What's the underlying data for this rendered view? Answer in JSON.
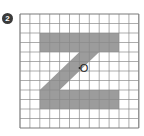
{
  "problem": {
    "number_label": "2"
  },
  "figure": {
    "grid": {
      "cols": 12,
      "rows": 12,
      "left": 20,
      "top": 14,
      "cell_w": 9.9,
      "cell_h": 9.5,
      "line_color": "#8a8a8a",
      "border_color": "#7a7a7a"
    },
    "shape": {
      "name": "Z",
      "fill": "#9c9c9c",
      "polygon_cells": [
        [
          2,
          2
        ],
        [
          10,
          2
        ],
        [
          10,
          4
        ],
        [
          8,
          4
        ],
        [
          4,
          8
        ],
        [
          10,
          8
        ],
        [
          10,
          10
        ],
        [
          2,
          10
        ],
        [
          2,
          8
        ],
        [
          6,
          4
        ],
        [
          2,
          4
        ]
      ]
    },
    "center_point": {
      "label": "O",
      "cx": 84,
      "cy": 68
    }
  }
}
